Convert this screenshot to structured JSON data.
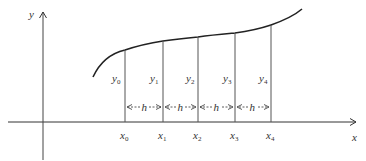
{
  "diagram": {
    "type": "trapezoid-rule-partition",
    "axes": {
      "x_label": "x",
      "y_label": "y"
    },
    "ordinates": [
      {
        "name": "y",
        "sub": "0"
      },
      {
        "name": "y",
        "sub": "1"
      },
      {
        "name": "y",
        "sub": "2"
      },
      {
        "name": "y",
        "sub": "3"
      },
      {
        "name": "y",
        "sub": "4"
      }
    ],
    "abscissae": [
      {
        "name": "x",
        "sub": "0"
      },
      {
        "name": "x",
        "sub": "1"
      },
      {
        "name": "x",
        "sub": "2"
      },
      {
        "name": "x",
        "sub": "3"
      },
      {
        "name": "x",
        "sub": "4"
      }
    ],
    "interval_label": "h",
    "interval_count": 4,
    "colors": {
      "line": "#333333",
      "thin_line": "#555555",
      "background": "#ffffff"
    }
  }
}
